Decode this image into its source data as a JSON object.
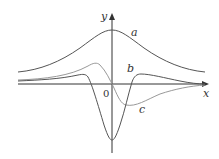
{
  "figure": {
    "axes": {
      "x_label": "x",
      "y_label": "y",
      "origin_label": "0"
    },
    "curves": [
      {
        "name": "a",
        "label": "a",
        "color": "#555555",
        "description": "bell-shaped curve, maximum at x=0, always positive"
      },
      {
        "name": "b",
        "label": "b",
        "color": "#555555",
        "description": "deep negative minimum at x=0, small positive bumps on each side"
      },
      {
        "name": "c",
        "label": "c",
        "color": "#999999",
        "description": "odd-like curve, positive peak left of 0, negative minimum right of 0"
      }
    ],
    "colors": {
      "axis": "#333333",
      "dark_curve": "#555555",
      "light_curve": "#999999",
      "background": "#ffffff"
    }
  }
}
